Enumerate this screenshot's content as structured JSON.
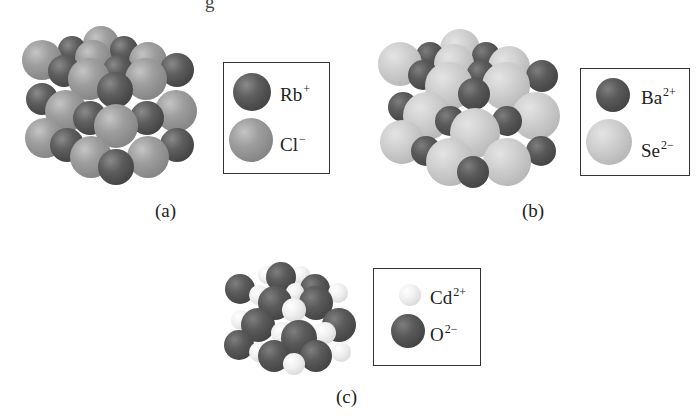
{
  "header_fragment": "g",
  "figures": [
    {
      "id": "a",
      "caption": "(a)",
      "legend": [
        {
          "symbol": "Rb",
          "charge": "+",
          "shade": "dark"
        },
        {
          "symbol": "Cl",
          "charge": "−",
          "shade": "mid"
        }
      ]
    },
    {
      "id": "b",
      "caption": "(b)",
      "legend": [
        {
          "symbol": "Ba",
          "charge": "2+",
          "shade": "dark"
        },
        {
          "symbol": "Se",
          "charge": "2−",
          "shade": "light"
        }
      ]
    },
    {
      "id": "c",
      "caption": "(c)",
      "legend": [
        {
          "symbol": "Cd",
          "charge": "2+",
          "shade": "white"
        },
        {
          "symbol": "O",
          "charge": "2−",
          "shade": "dark"
        }
      ]
    }
  ],
  "colors": {
    "dark_sphere": "#4a4a4a",
    "mid_sphere": "#929292",
    "light_sphere": "#c6c6c6",
    "white_sphere": "#ececec",
    "legend_border": "#333333"
  }
}
